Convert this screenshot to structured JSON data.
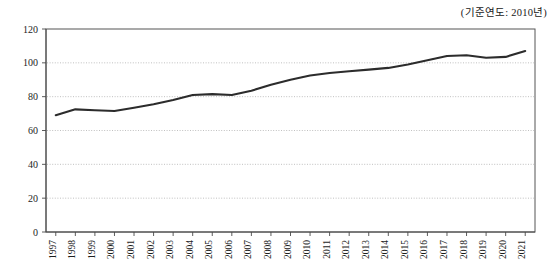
{
  "note": "(기준연도: 2010년)",
  "chart_data": {
    "type": "line",
    "title": "",
    "subtitle": "",
    "annotations": [
      "(기준연도: 2010년)"
    ],
    "xlabel": "",
    "ylabel": "",
    "ylim": [
      0,
      120
    ],
    "yticks": [
      0,
      20,
      40,
      60,
      80,
      100,
      120
    ],
    "ytick_labels": [
      "0",
      "20",
      "40",
      "60",
      "80",
      "100",
      "120"
    ],
    "grid": true,
    "grid_axis": "y",
    "legend": false,
    "legend_position": "none",
    "line_color": "#2c2c2c",
    "categories": [
      "1997",
      "1998",
      "1999",
      "2000",
      "2001",
      "2002",
      "2003",
      "2004",
      "2005",
      "2006",
      "2007",
      "2008",
      "2009",
      "2010",
      "2011",
      "2012",
      "2013",
      "2014",
      "2015",
      "2016",
      "2017",
      "2018",
      "2019",
      "2020",
      "2021"
    ],
    "values": [
      69.0,
      72.5,
      72.0,
      71.5,
      73.5,
      75.5,
      78.0,
      81.0,
      81.5,
      81.0,
      83.5,
      87.0,
      90.0,
      92.5,
      94.0,
      95.0,
      96.0,
      97.0,
      99.0,
      101.5,
      104.0,
      104.5,
      103.0,
      103.5,
      107.0
    ]
  }
}
